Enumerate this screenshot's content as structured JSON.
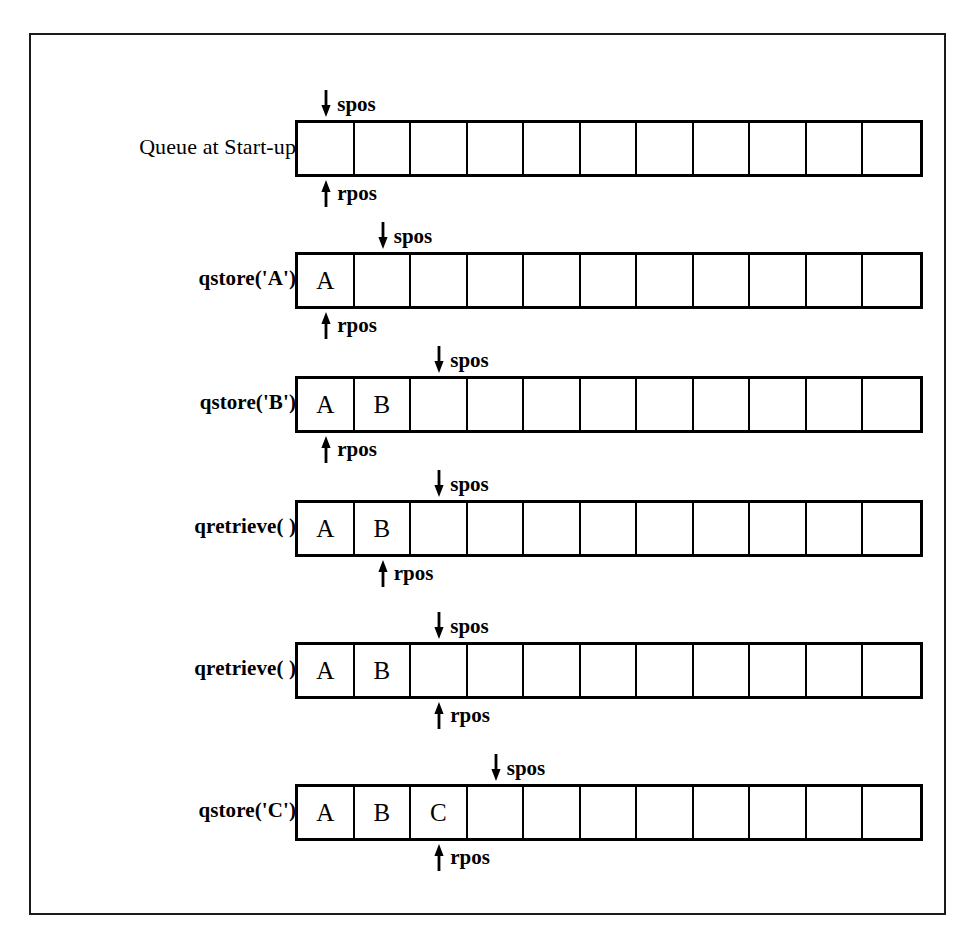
{
  "figure": {
    "colors": {
      "ink": "#000000",
      "background": "#ffffff",
      "frame": "#1a1a1a"
    },
    "queue_size": 11,
    "pointer_names": {
      "store": "spos",
      "retrieve": "rpos"
    },
    "rows": [
      {
        "label": "Queue at Start-up",
        "label_bold": false,
        "cells": [
          "",
          "",
          "",
          "",
          "",
          "",
          "",
          "",
          "",
          "",
          ""
        ],
        "spos_index": 0,
        "rpos_index": 0,
        "spos_label": "spos",
        "rpos_label": "rpos"
      },
      {
        "label": "qstore('A')",
        "label_bold": true,
        "cells": [
          "A",
          "",
          "",
          "",
          "",
          "",
          "",
          "",
          "",
          "",
          ""
        ],
        "spos_index": 1,
        "rpos_index": 0,
        "spos_label": "spos",
        "rpos_label": "rpos"
      },
      {
        "label": "qstore('B')",
        "label_bold": true,
        "cells": [
          "A",
          "B",
          "",
          "",
          "",
          "",
          "",
          "",
          "",
          "",
          ""
        ],
        "spos_index": 2,
        "rpos_index": 0,
        "spos_label": "spos",
        "rpos_label": "rpos"
      },
      {
        "label": "qretrieve( )",
        "label_bold": true,
        "cells": [
          "A",
          "B",
          "",
          "",
          "",
          "",
          "",
          "",
          "",
          "",
          ""
        ],
        "spos_index": 2,
        "rpos_index": 1,
        "spos_label": "spos",
        "rpos_label": "rpos"
      },
      {
        "label": "qretrieve( )",
        "label_bold": true,
        "cells": [
          "A",
          "B",
          "",
          "",
          "",
          "",
          "",
          "",
          "",
          "",
          ""
        ],
        "spos_index": 2,
        "rpos_index": 2,
        "spos_label": "spos",
        "rpos_label": "rpos"
      },
      {
        "label": "qstore('C')",
        "label_bold": true,
        "cells": [
          "A",
          "B",
          "C",
          "",
          "",
          "",
          "",
          "",
          "",
          "",
          ""
        ],
        "spos_index": 3,
        "rpos_index": 2,
        "spos_label": "spos",
        "rpos_label": "rpos"
      }
    ],
    "row_tops": [
      85,
      217,
      341,
      465,
      607,
      749
    ]
  }
}
